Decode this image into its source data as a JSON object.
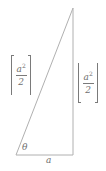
{
  "figure": {
    "type": "geometry-diagram",
    "background_color": "#ffffff",
    "stroke_color": "#a8a8a8",
    "text_color": "#6f6f6f"
  },
  "triangle": {
    "name": "right-triangle",
    "vertices": {
      "apex": {
        "x": 73,
        "y": 8
      },
      "bottom_left": {
        "x": 16,
        "y": 155
      },
      "bottom_right": {
        "x": 73,
        "y": 155
      }
    },
    "sides": {
      "hypotenuse": "apex-to-bottom-left",
      "vertical": "apex-to-bottom-right",
      "base": "bottom-left-to-bottom-right"
    }
  },
  "labels": {
    "ceiling_expression": {
      "kind": "ceiling",
      "open_bracket": "⌈",
      "close_bracket": "⌉",
      "numerator": "a",
      "numerator_exponent": "2",
      "denominator": "2",
      "plain_text": "⌈a²/2⌉"
    },
    "floor_expression": {
      "kind": "floor",
      "open_bracket": "⌊",
      "close_bracket": "⌋",
      "numerator": "a",
      "numerator_exponent": "2",
      "denominator": "2",
      "plain_text": "⌊a²/2⌋"
    },
    "angle": "θ",
    "base": "a"
  }
}
